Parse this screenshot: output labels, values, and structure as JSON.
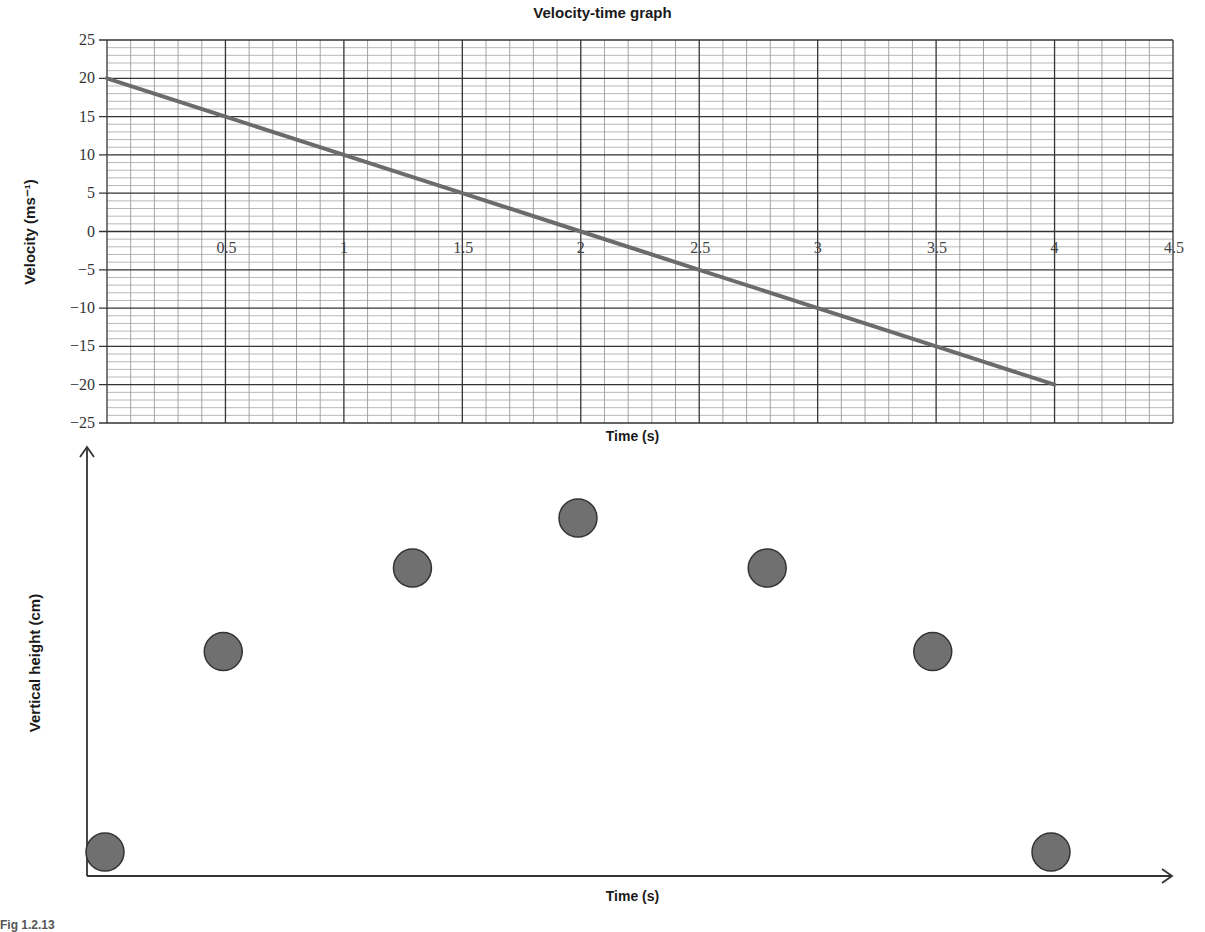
{
  "chart_data": [
    {
      "type": "line",
      "title": "Velocity-time graph",
      "xlabel": "Time (s)",
      "ylabel": "Velocity (ms⁻¹)",
      "xlim": [
        0,
        4.5
      ],
      "ylim": [
        -25,
        25
      ],
      "x_ticks": [
        "0.5",
        "1",
        "1.5",
        "2",
        "2.5",
        "3",
        "3.5",
        "4",
        "4.5"
      ],
      "y_ticks": [
        "25",
        "20",
        "15",
        "10",
        "5",
        "0",
        "−5",
        "−10",
        "−15",
        "−20",
        "−25"
      ],
      "grid": true,
      "series": [
        {
          "name": "velocity",
          "x": [
            0,
            0.5,
            1,
            1.5,
            2,
            2.5,
            3,
            3.5,
            4
          ],
          "values": [
            20,
            15,
            10,
            5,
            0,
            -5,
            -10,
            -15,
            -20
          ],
          "color": "#666666"
        }
      ]
    },
    {
      "type": "scatter",
      "title": "",
      "xlabel": "Time (s)",
      "ylabel": "Vertical height (cm)",
      "grid": false,
      "axis_ticks": false,
      "series": [
        {
          "name": "ball positions",
          "x": [
            0,
            0.5,
            1.3,
            2,
            2.8,
            3.5,
            4
          ],
          "values": [
            0,
            0.6,
            0.85,
            1.0,
            0.85,
            0.6,
            0
          ],
          "color": "#6e6e6e",
          "note": "relative heights; axes unlabeled"
        }
      ]
    }
  ],
  "caption": "Fig 1.2.13",
  "colors": {
    "line": "#6b6b6b",
    "ball_fill": "#707070",
    "ball_stroke": "#333333",
    "grid_major": "#333333",
    "grid_minor": "#9a9a9a"
  }
}
